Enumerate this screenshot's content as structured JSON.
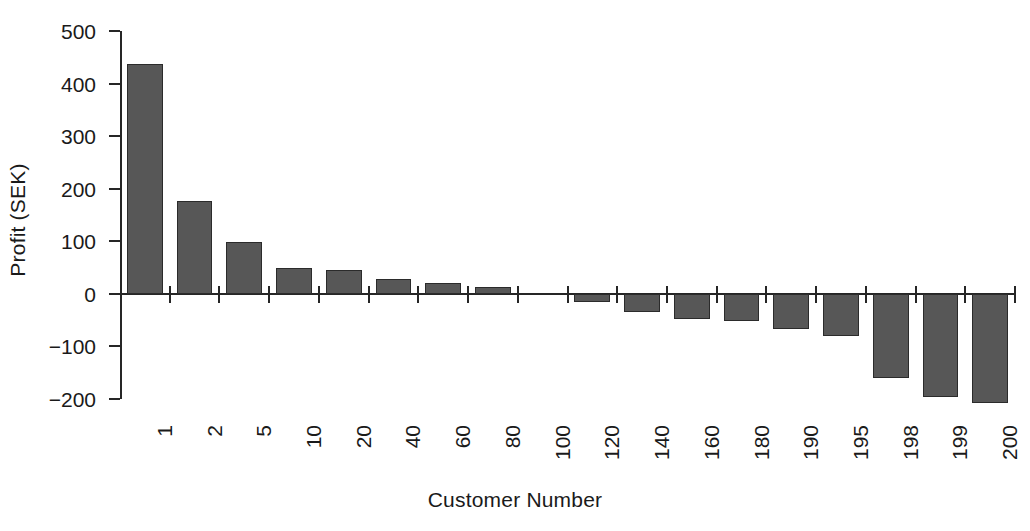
{
  "figure": {
    "caption_fragment": "",
    "background_color": "#ffffff"
  },
  "chart_data": {
    "type": "bar",
    "title": "",
    "xlabel": "Customer Number",
    "ylabel": "Profit (SEK)",
    "categories": [
      "1",
      "2",
      "5",
      "10",
      "20",
      "40",
      "60",
      "80",
      "100",
      "120",
      "140",
      "160",
      "180",
      "190",
      "195",
      "198",
      "199",
      "200"
    ],
    "values": [
      437,
      177,
      98,
      50,
      45,
      28,
      21,
      13,
      0,
      -15,
      -35,
      -47,
      -52,
      -67,
      -80,
      -161,
      -196,
      -207
    ],
    "ylim": [
      -200,
      500
    ],
    "yticks": [
      500,
      400,
      300,
      200,
      100,
      0,
      -100,
      -200
    ],
    "ytick_labels": [
      "500",
      "400",
      "300",
      "200",
      "100",
      "0",
      "−100",
      "−200"
    ],
    "grid": false,
    "legend": false,
    "bar_color": "#575757",
    "bar_edge_color": "#2b2b2b",
    "axis_color": "#262626"
  }
}
